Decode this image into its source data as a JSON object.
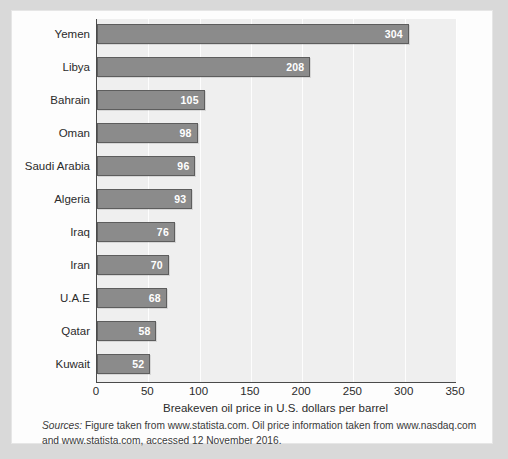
{
  "figure": {
    "sources_label": "Sources:",
    "sources_text": " Figure taken from www.statista.com. Oil price information taken from www.nasdaq.com and www.statista.com, accessed 12 November 2016."
  },
  "chart_data": {
    "type": "bar",
    "orientation": "horizontal",
    "title": "",
    "xlabel": "Breakeven oil price in U.S. dollars per barrel",
    "ylabel": "",
    "categories": [
      "Yemen",
      "Libya",
      "Bahrain",
      "Oman",
      "Saudi Arabia",
      "Algeria",
      "Iraq",
      "Iran",
      "U.A.E",
      "Qatar",
      "Kuwait"
    ],
    "values": [
      304,
      208,
      105,
      98,
      96,
      93,
      76,
      70,
      68,
      58,
      52
    ],
    "value_labels": [
      "304",
      "208",
      "105",
      "98",
      "96",
      "93",
      "76",
      "70",
      "68",
      "58",
      "52"
    ],
    "xlim": [
      0,
      350
    ],
    "xticks": [
      0,
      50,
      100,
      150,
      200,
      250,
      300,
      350
    ],
    "xtick_labels": [
      "0",
      "50",
      "100",
      "150",
      "200",
      "250",
      "300",
      "350"
    ],
    "grid": true,
    "grid_axis": "x",
    "legend": false,
    "bar_color": "#8b8b8b",
    "bar_border_color": "#5d5d5d",
    "plot_background": "#efefef",
    "value_label_color": "#ffffff"
  }
}
